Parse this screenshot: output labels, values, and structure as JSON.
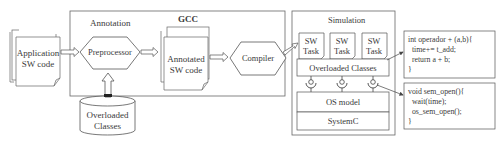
{
  "groups": {
    "annotation": {
      "label": "Annotation"
    },
    "gcc": {
      "label": "GCC"
    },
    "simulation": {
      "label": "Simulation"
    }
  },
  "nodes": {
    "application_sw_code": {
      "line1": "Application",
      "line2": "SW code"
    },
    "preprocessor": {
      "label": "Preprocessor"
    },
    "annotated_sw_code": {
      "line1": "Annotated",
      "line2": "SW code"
    },
    "compiler": {
      "label": "Compiler"
    },
    "overloaded_classes_db": {
      "line1": "Overloaded",
      "line2": "Classes"
    },
    "sw_tasks": [
      {
        "line1": "SW",
        "line2": "Task"
      },
      {
        "line1": "SW",
        "line2": "Task"
      },
      {
        "line1": "SW",
        "line2": "Task"
      }
    ],
    "overloaded_classes_layer": {
      "label": "Overloaded Classes"
    },
    "os_model": {
      "label": "OS model"
    },
    "systemc": {
      "label": "SystemC"
    }
  },
  "code_boxes": [
    {
      "lines": [
        "int operador + (a,b){",
        "  time+= t_add;",
        "  return a + b;",
        "}"
      ]
    },
    {
      "lines": [
        "void sem_open(){",
        "  wait(time);",
        "  os_sem_open();",
        "}"
      ]
    }
  ],
  "colors": {
    "stroke": "#555555",
    "text": "#3a3a3a",
    "background": "#ffffff"
  }
}
